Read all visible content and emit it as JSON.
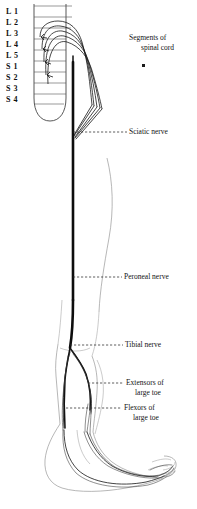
{
  "figure": {
    "background_color": "#ffffff",
    "ink_color": "#1b1b1b",
    "faint_outline_color": "#8f8f8f"
  },
  "spinal_cord": {
    "segment_labels": [
      "L 1",
      "L 2",
      "L 3",
      "L 4",
      "L 5",
      "S 1",
      "S 2",
      "S 3",
      "S 4"
    ],
    "caption": {
      "line1": "Segments of",
      "line2": "spinal cord"
    },
    "marker": "dot-marker"
  },
  "callouts": [
    {
      "id": "sciatic-nerve",
      "line1": "Sciatic nerve",
      "line2": ""
    },
    {
      "id": "peroneal-nerve",
      "line1": "Peroneal nerve",
      "line2": ""
    },
    {
      "id": "tibial-nerve",
      "line1": "Tibial nerve",
      "line2": ""
    },
    {
      "id": "extensors-of-large-toe",
      "line1": "Extensors of",
      "line2": "large toe"
    },
    {
      "id": "flexors-of-large-toe",
      "line1": "Flexors of",
      "line2": "large toe"
    }
  ]
}
